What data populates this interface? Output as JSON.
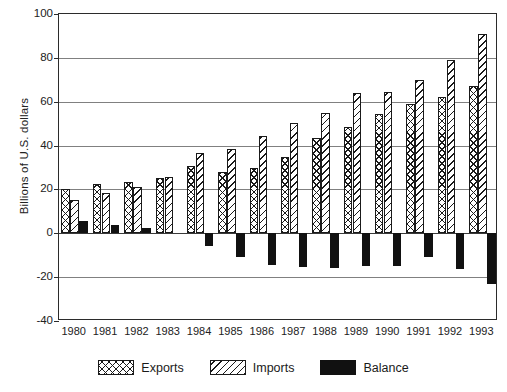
{
  "chart_data": {
    "type": "bar",
    "title": "",
    "xlabel": "",
    "ylabel": "Billions of U.S. dollars",
    "ylim": [
      -40,
      100
    ],
    "yticks": [
      -40,
      -20,
      0,
      20,
      40,
      60,
      80,
      100
    ],
    "ytick_labels": [
      "-40",
      "-20",
      "0",
      "20",
      "40",
      "60",
      "80",
      "100"
    ],
    "grid": true,
    "legend_position": "bottom",
    "categories": [
      "1980",
      "1981",
      "1982",
      "1983",
      "1984",
      "1985",
      "1986",
      "1987",
      "1988",
      "1989",
      "1990",
      "1991",
      "1992",
      "1993"
    ],
    "series": [
      {
        "name": "Exports",
        "pattern": "cross-hatch",
        "color": "#1a1a1a",
        "values": [
          20,
          22.5,
          23.5,
          25,
          30.5,
          28,
          30,
          35,
          43.5,
          48.5,
          54.5,
          59,
          62,
          67
        ]
      },
      {
        "name": "Imports",
        "pattern": "diagonal-hatch",
        "color": "#1a1a1a",
        "values": [
          15,
          18.5,
          21,
          25.5,
          36.5,
          38.5,
          44.5,
          50.5,
          55,
          64,
          64.5,
          70,
          79,
          91
        ]
      },
      {
        "name": "Balance",
        "pattern": "solid",
        "color": "#111111",
        "values": [
          5.5,
          4,
          2.5,
          0,
          -6,
          -11,
          -14.5,
          -15.5,
          -16,
          -15,
          -15,
          -11,
          -16.5,
          -23
        ]
      }
    ]
  },
  "legend": {
    "items": [
      {
        "label": "Exports",
        "key": "exports"
      },
      {
        "label": "Imports",
        "key": "imports"
      },
      {
        "label": "Balance",
        "key": "balance"
      }
    ]
  }
}
